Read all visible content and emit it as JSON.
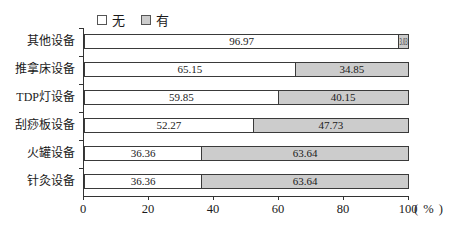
{
  "chart_data": {
    "type": "bar",
    "orientation": "horizontal",
    "stacked": true,
    "title": "",
    "categories": [
      "其他设备",
      "推拿床设备",
      "TDP灯设备",
      "刮痧板设备",
      "火罐设备",
      "针灸设备"
    ],
    "series": [
      {
        "name": "无",
        "color": "#ffffff",
        "values": [
          96.97,
          65.15,
          59.85,
          52.27,
          36.36,
          36.36
        ]
      },
      {
        "name": "有",
        "color": "#cccccc",
        "values": [
          3.03,
          34.85,
          40.15,
          47.73,
          63.64,
          63.64
        ]
      }
    ],
    "x_ticks": [
      0,
      20,
      40,
      60,
      80,
      100
    ],
    "xlim": [
      0,
      100
    ],
    "x_axis_unit": "( % )",
    "legend_position": "top",
    "value_labels": "shown inside segments, two decimals",
    "grid": false
  },
  "colors": {
    "background": "#ffffff",
    "bar_border": "#3a3a3a",
    "axis": "#333333",
    "text": "#1a1a1a",
    "series_none_fill": "#ffffff",
    "series_have_fill": "#cccccc"
  }
}
